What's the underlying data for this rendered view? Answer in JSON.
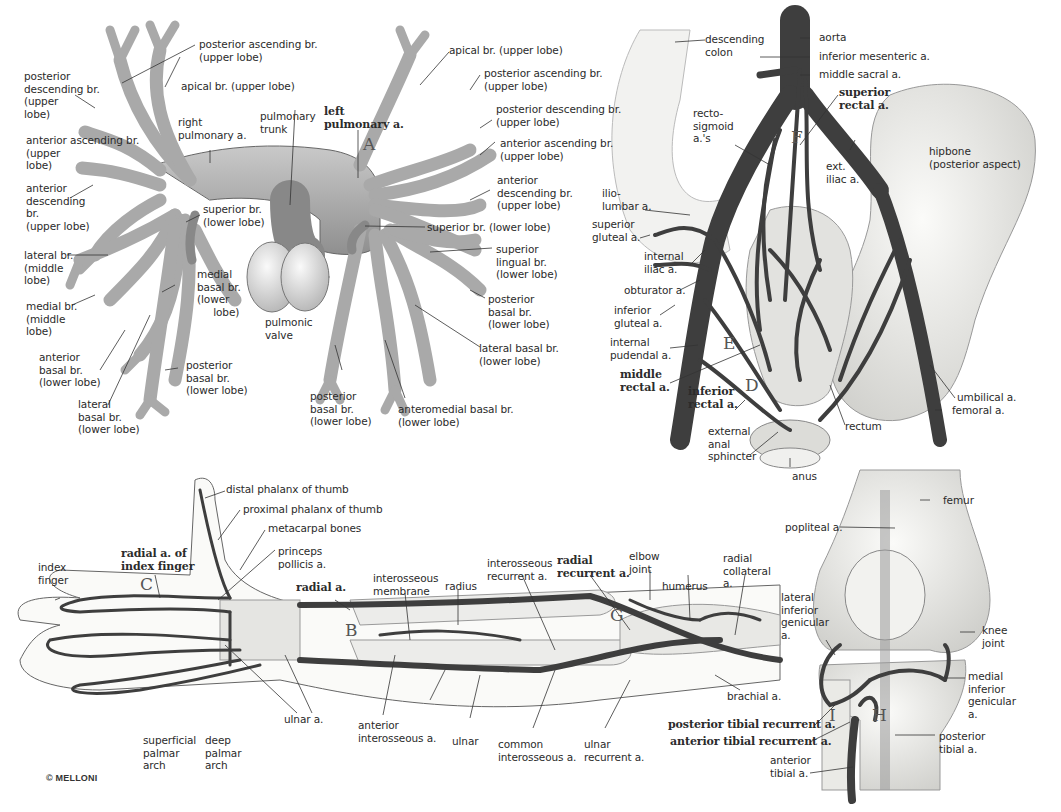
{
  "copyright": "© MELLONI",
  "panels": {
    "pulmonary": {
      "letter": "A",
      "labels": {
        "post_asc_r": "posterior ascending br.\n(upper lobe)",
        "apical_r": "apical br. (upper lobe)",
        "post_desc_r": "posterior\ndescending br.\n(upper\nlobe)",
        "right_pulm": "right\npulmonary a.",
        "pulm_trunk": "pulmonary\ntrunk",
        "left_pulm": "left\npulmonary a.",
        "ant_asc_r": "anterior ascending br.\n(upper\nlobe)",
        "ant_desc_r": "anterior\ndescending\nbr.\n(upper lobe)",
        "sup_lower_r": "superior br.\n(lower lobe)",
        "lateral_mid": "lateral br.\n(middle\nlobe)",
        "medial_basal_r": "medial\nbasal br.\n(lower\n     lobe)",
        "pulm_valve": "pulmonic\nvalve",
        "medial_mid": "medial br.\n(middle\nlobe)",
        "ant_basal_r": "anterior\nbasal br.\n(lower lobe)",
        "post_basal_r": "posterior\nbasal br.\n(lower lobe)",
        "lat_basal_r": "lateral\nbasal br.\n(lower lobe)",
        "apical_l": "apical br. (upper lobe)",
        "post_asc_l": "posterior ascending br.\n(upper lobe)",
        "post_desc_l": "posterior descending br.\n(upper lobe)",
        "ant_asc_l": "anterior ascending br.\n(upper lobe)",
        "ant_desc_l": "anterior\ndescending br.\n(upper lobe)",
        "sup_lower_l": "superior br. (lower lobe)",
        "sup_lingual": "superior\nlingual br.\n(lower lobe)",
        "post_basal_l2": "posterior\nbasal br.\n(lower lobe)",
        "lat_basal_l": "lateral basal br.\n(lower lobe)",
        "post_basal_l": "posterior\nbasal br.\n(lower lobe)",
        "anteromedial": "anteromedial basal br.\n(lower lobe)"
      }
    },
    "pelvis": {
      "letters": [
        "F",
        "E",
        "D"
      ],
      "labels": {
        "desc_colon": "descending\ncolon",
        "aorta": "aorta",
        "inf_mes": "inferior mesenteric a.",
        "mid_sacral": "middle sacral a.",
        "sup_rectal": "superior\nrectal a.",
        "recto_sig": "recto-\nsigmoid\na.'s",
        "ext_iliac": "ext.\niliac a.",
        "hipbone": "hipbone\n(posterior aspect)",
        "iliolumbar": "ilio-\nlumbar a.",
        "sup_gluteal": "superior\ngluteal a.",
        "int_iliac": "internal\niliac a.",
        "obturator": "obturator a.",
        "inf_gluteal": "inferior\ngluteal a.",
        "int_pudendal": "internal\npudendal a.",
        "mid_rectal": "middle\nrectal a.",
        "inf_rectal": "inferior\nrectal a.",
        "ext_anal": "external\nanal\nsphincter",
        "anus": "anus",
        "rectum": "rectum",
        "umbilical": "umbilical a.",
        "femoral": "femoral a."
      }
    },
    "forearm": {
      "letters": [
        "C",
        "B",
        "G"
      ],
      "labels": {
        "distal_thumb": "distal phalanx of thumb",
        "proximal_thumb": "proximal phalanx of thumb",
        "metacarpal": "metacarpal bones",
        "princeps": "princeps\npollicis a.",
        "index_finger": "index\nfinger",
        "radial_index": "radial a. of\nindex finger",
        "radial_a": "radial a.",
        "interosseous_mem": "interosseous\nmembrane",
        "radius": "radius",
        "interosseous_rec": "interosseous\nrecurrent a.",
        "radial_rec": "radial\nrecurrent a.",
        "elbow": "elbow\njoint",
        "humerus": "humerus",
        "radial_coll": "radial\ncollateral\na.",
        "brachial": "brachial a.",
        "ulnar_a": "ulnar a.",
        "ant_interosseous": "anterior\ninterosseous a.",
        "ulnar": "ulnar",
        "common_interosseous": "common\ninterosseous a.",
        "ulnar_rec": "ulnar\nrecurrent a.",
        "sup_palmar": "superficial\npalmar\narch",
        "deep_palmar": "deep\npalmar\narch"
      }
    },
    "knee": {
      "letters": [
        "I",
        "H"
      ],
      "labels": {
        "femur": "femur",
        "popliteal": "popliteal a.",
        "lat_inf_gen": "lateral\ninferior\ngenicular\na.",
        "knee_joint": "knee\njoint",
        "med_inf_gen": "medial\ninferior\ngenicular\na.",
        "post_tib_rec": "posterior tibial recurrent a.",
        "ant_tib_rec": "anterior tibial recurrent a.",
        "post_tibial": "posterior\ntibial a.",
        "ant_tibial": "anterior\ntibial a."
      }
    }
  },
  "colors": {
    "pulmonary_vessel": "#a8a8a8",
    "artery_dark": "#4a4a4a",
    "bone": "#e8e8e6",
    "outline": "#555555"
  }
}
